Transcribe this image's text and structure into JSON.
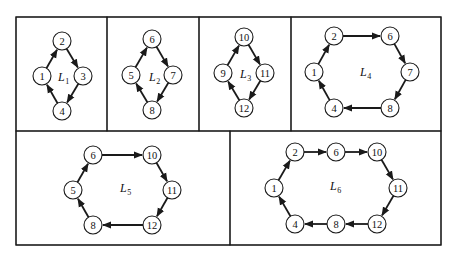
{
  "figure": {
    "outer_box": {
      "x": 16,
      "y": 17,
      "w": 425,
      "h": 228
    },
    "arrow_color": "#1a1a1a",
    "panels": [
      {
        "id": "L1",
        "label": "L",
        "subscript": "1",
        "box": {
          "x": 16,
          "y": 17,
          "w": 91,
          "h": 114
        },
        "label_pos": {
          "x": 58,
          "y": 81
        },
        "nodes": [
          {
            "id": "2",
            "x": 62,
            "y": 41
          },
          {
            "id": "3",
            "x": 83,
            "y": 76
          },
          {
            "id": "4",
            "x": 62,
            "y": 111
          },
          {
            "id": "1",
            "x": 42,
            "y": 76
          }
        ],
        "cycle": [
          "1",
          "2",
          "3",
          "4",
          "1"
        ]
      },
      {
        "id": "L2",
        "label": "L",
        "subscript": "2",
        "box": {
          "x": 107,
          "y": 17,
          "w": 92,
          "h": 114
        },
        "label_pos": {
          "x": 149,
          "y": 81
        },
        "nodes": [
          {
            "id": "6",
            "x": 152,
            "y": 39
          },
          {
            "id": "7",
            "x": 173,
            "y": 75
          },
          {
            "id": "8",
            "x": 152,
            "y": 110
          },
          {
            "id": "5",
            "x": 131,
            "y": 75
          }
        ],
        "cycle": [
          "5",
          "6",
          "7",
          "8",
          "5"
        ]
      },
      {
        "id": "L3",
        "label": "L",
        "subscript": "3",
        "box": {
          "x": 199,
          "y": 17,
          "w": 92,
          "h": 114
        },
        "label_pos": {
          "x": 240,
          "y": 78
        },
        "nodes": [
          {
            "id": "10",
            "x": 244,
            "y": 37
          },
          {
            "id": "11",
            "x": 265,
            "y": 73
          },
          {
            "id": "12",
            "x": 244,
            "y": 108
          },
          {
            "id": "9",
            "x": 223,
            "y": 73
          }
        ],
        "cycle": [
          "9",
          "10",
          "11",
          "12",
          "9"
        ]
      },
      {
        "id": "L4",
        "label": "L",
        "subscript": "4",
        "box": {
          "x": 291,
          "y": 17,
          "w": 150,
          "h": 114
        },
        "label_pos": {
          "x": 360,
          "y": 76
        },
        "nodes": [
          {
            "id": "2",
            "x": 334,
            "y": 36
          },
          {
            "id": "6",
            "x": 390,
            "y": 36
          },
          {
            "id": "7",
            "x": 410,
            "y": 72
          },
          {
            "id": "8",
            "x": 390,
            "y": 108
          },
          {
            "id": "4",
            "x": 334,
            "y": 108
          },
          {
            "id": "1",
            "x": 314,
            "y": 72
          }
        ],
        "cycle": [
          "1",
          "2",
          "6",
          "7",
          "8",
          "4",
          "1"
        ]
      },
      {
        "id": "L5",
        "label": "L",
        "subscript": "5",
        "box": {
          "x": 16,
          "y": 131,
          "w": 214,
          "h": 114
        },
        "label_pos": {
          "x": 120,
          "y": 192
        },
        "nodes": [
          {
            "id": "6",
            "x": 93,
            "y": 155
          },
          {
            "id": "10",
            "x": 152,
            "y": 155
          },
          {
            "id": "11",
            "x": 172,
            "y": 190
          },
          {
            "id": "12",
            "x": 152,
            "y": 225
          },
          {
            "id": "8",
            "x": 93,
            "y": 225
          },
          {
            "id": "5",
            "x": 73,
            "y": 190
          }
        ],
        "cycle": [
          "5",
          "6",
          "10",
          "11",
          "12",
          "8",
          "5"
        ]
      },
      {
        "id": "L6",
        "label": "L",
        "subscript": "6",
        "box": {
          "x": 230,
          "y": 131,
          "w": 211,
          "h": 114
        },
        "label_pos": {
          "x": 330,
          "y": 190
        },
        "nodes": [
          {
            "id": "2",
            "x": 295,
            "y": 152
          },
          {
            "id": "6",
            "x": 336,
            "y": 152
          },
          {
            "id": "10",
            "x": 377,
            "y": 152
          },
          {
            "id": "11",
            "x": 398,
            "y": 188
          },
          {
            "id": "12",
            "x": 377,
            "y": 224
          },
          {
            "id": "8",
            "x": 336,
            "y": 224
          },
          {
            "id": "4",
            "x": 295,
            "y": 224
          },
          {
            "id": "1",
            "x": 274,
            "y": 188
          }
        ],
        "cycle": [
          "1",
          "2",
          "6",
          "10",
          "11",
          "12",
          "8",
          "4",
          "1"
        ]
      }
    ]
  }
}
